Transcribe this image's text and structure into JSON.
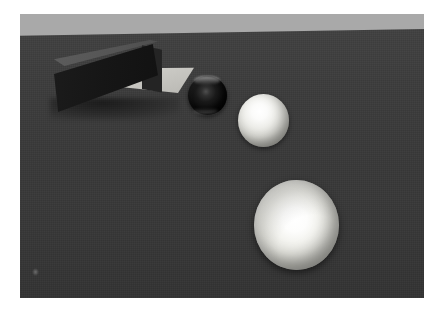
{
  "scene": {
    "title": "Ray-traced sphere scene",
    "render_type": "3d-raytraced-render",
    "canvas": {
      "width": 442,
      "height": 314,
      "border_color": "#ffffff"
    },
    "viewport": {
      "left": 20,
      "top": 14,
      "width": 404,
      "height": 284
    },
    "background": {
      "name": "back-wall",
      "color": "#a9a9a9",
      "horizon_y_left": 36,
      "horizon_y_right": 29
    },
    "floor": {
      "name": "ground-plane",
      "color": "#3a3a3a",
      "finish": "matte-grainy"
    },
    "light_patch": {
      "name": "illuminated-floor-quad",
      "color": "#d0cfca",
      "shape": "quadrilateral",
      "bounds": {
        "x": 94,
        "y": 67,
        "width": 100,
        "height": 26
      }
    },
    "wall_slab": {
      "name": "dark-wall-block",
      "top_face_color": "#555555",
      "front_face_color": "#161616",
      "end_face_color": "#242424",
      "bounds": {
        "x": 54,
        "y": 40,
        "width": 108,
        "height": 72
      }
    },
    "objects": [
      {
        "name": "black-glossy-sphere",
        "material": "glossy-black",
        "base_color": "#0a0a0a",
        "highlight_color": "#4e4e4e",
        "center": {
          "x": 208,
          "y": 96
        },
        "radius": 20
      },
      {
        "name": "white-sphere-medium",
        "material": "diffuse-white",
        "base_color": "#eeeeea",
        "highlight_color": "#ffffff",
        "center": {
          "x": 264,
          "y": 121
        },
        "radius": 26
      },
      {
        "name": "white-sphere-large",
        "material": "diffuse-white",
        "base_color": "#f4f4f0",
        "highlight_color": "#ffffff",
        "center": {
          "x": 297,
          "y": 225
        },
        "radius": 44
      }
    ],
    "artifact": {
      "name": "corner-speck",
      "x": 32,
      "y": 284
    }
  }
}
